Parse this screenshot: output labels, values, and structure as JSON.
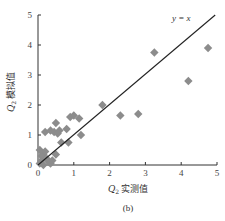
{
  "chart_data": {
    "type": "scatter",
    "title": "",
    "caption": "(b)",
    "xlabel": "Q₂ 实测值",
    "ylabel": "Q₂ 模拟值",
    "xlim": [
      0,
      5
    ],
    "ylim": [
      0,
      5
    ],
    "xticks": [
      0,
      1,
      2,
      3,
      4,
      5
    ],
    "yticks": [
      0,
      1,
      2,
      3,
      4,
      5
    ],
    "grid": false,
    "legend": null,
    "reference_line": {
      "label": "y = x",
      "from": [
        0,
        0
      ],
      "to": [
        4.95,
        5.0
      ]
    },
    "series": [
      {
        "name": "Q2",
        "marker": "diamond",
        "color": "#8c8c8c",
        "points": [
          [
            0.05,
            0.05
          ],
          [
            0.1,
            0.15
          ],
          [
            0.15,
            0.35
          ],
          [
            0.05,
            0.5
          ],
          [
            0.2,
            0.45
          ],
          [
            0.1,
            0.3
          ],
          [
            0.25,
            0.2
          ],
          [
            0.3,
            0.1
          ],
          [
            0.35,
            0.05
          ],
          [
            0.15,
            0.0
          ],
          [
            0.4,
            0.15
          ],
          [
            0.5,
            0.35
          ],
          [
            0.65,
            0.75
          ],
          [
            0.85,
            0.75
          ],
          [
            0.2,
            1.1
          ],
          [
            0.35,
            1.15
          ],
          [
            0.45,
            1.1
          ],
          [
            0.5,
            1.4
          ],
          [
            0.6,
            1.15
          ],
          [
            0.55,
            1.05
          ],
          [
            0.8,
            1.2
          ],
          [
            0.9,
            1.6
          ],
          [
            1.0,
            1.65
          ],
          [
            1.15,
            1.55
          ],
          [
            1.2,
            1.0
          ],
          [
            1.8,
            2.0
          ],
          [
            2.3,
            1.65
          ],
          [
            2.8,
            1.7
          ],
          [
            3.25,
            3.75
          ],
          [
            4.2,
            2.8
          ],
          [
            4.75,
            3.9
          ]
        ]
      }
    ]
  },
  "labels": {
    "eq": "y = x",
    "xlabel_q": "Q",
    "xlabel_sub": "2",
    "xlabel_text": "实测值",
    "ylabel_q": "Q",
    "ylabel_sub": "2",
    "ylabel_text": "模拟值",
    "caption": "(b)"
  },
  "style": {
    "marker_color": "#8c8c8c",
    "axis_color": "#333333",
    "line_color": "#222222"
  }
}
